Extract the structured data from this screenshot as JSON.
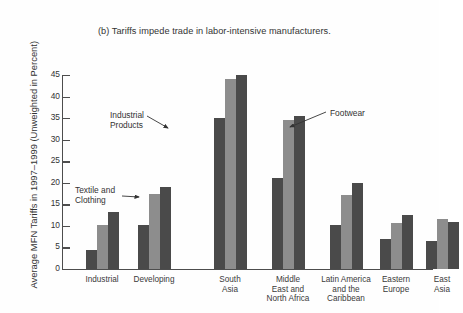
{
  "chart_data": {
    "type": "bar",
    "title": "(b) Tariffs impede trade in labor-intensive manufacturers.",
    "xlabel": "",
    "ylabel": "Average MFN Tariffs in 1997–1999 (Unweighted in Percent)",
    "ylim": [
      0,
      45
    ],
    "yticks": [
      0,
      5,
      10,
      15,
      20,
      25,
      30,
      35,
      40,
      45
    ],
    "ytick_labels": [
      "0",
      "5",
      "10",
      "15",
      "20",
      "25",
      "30",
      "35",
      "40",
      "45"
    ],
    "grid": false,
    "legend_position": "annotations-with-leader-lines",
    "categories": [
      "Industrial",
      "Developing",
      "South\nAsia",
      "Middle\nEast and\nNorth Africa",
      "Latin America\nand the\nCaribbean",
      "Eastern\nEurope",
      "East\nAsia"
    ],
    "series": [
      {
        "name": "Industrial Products",
        "color": "#4a4a4a",
        "values": [
          4.5,
          10.2,
          35.0,
          21.0,
          10.2,
          7.0,
          6.5
        ]
      },
      {
        "name": "Textile and Clothing",
        "color": "#8d8d8d",
        "values": [
          10.2,
          17.3,
          44.0,
          34.5,
          17.2,
          10.6,
          11.5
        ]
      },
      {
        "name": "Footwear",
        "color": "#4a4a4a",
        "values": [
          13.2,
          19.0,
          45.0,
          35.5,
          20.0,
          12.5,
          10.9
        ]
      }
    ],
    "annotations": [
      {
        "id": "industrial-products",
        "text": "Industrial\nProducts",
        "points_to": "series-0-bar-south-asia"
      },
      {
        "id": "textile-clothing",
        "text": "Textile and\nClothing",
        "points_to": "series-1-bar-developing"
      },
      {
        "id": "footwear",
        "text": "Footwear",
        "points_to": "series-2-bar-middle-east-and-north-africa"
      }
    ]
  }
}
